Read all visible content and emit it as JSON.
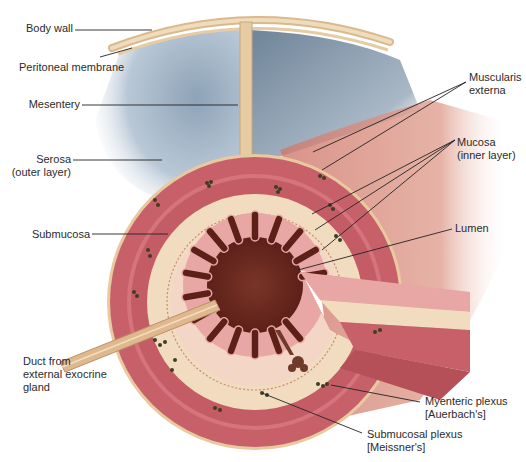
{
  "diagram": {
    "labels": {
      "body_wall": "Body wall",
      "peritoneal_membrane": "Peritoneal membrane",
      "mesentery": "Mesentery",
      "serosa": "Serosa\n(outer layer)",
      "submucosa": "Submucosa",
      "duct": "Duct from\nexternal exocrine\ngland",
      "muscularis_externa": "Muscularis\nexterna",
      "mucosa": "Mucosa\n(inner layer)",
      "lumen": "Lumen",
      "myenteric_plexus": "Myenteric plexus\n[Auerbach's]",
      "submucosal_plexus": "Submucosal plexus\n[Meissner's]"
    },
    "colors": {
      "muscle": "#c8606a",
      "muscle_light": "#e39aa0",
      "submucosa": "#f2dcc0",
      "serosa": "#e8c9a0",
      "mucosa": "#e8a7a4",
      "lumen": "#6e2a22",
      "peritoneal_cavity": "#a8b8c8",
      "body_wall": "#e6cba3",
      "plexus": "#4a4a2a",
      "leader": "#222222"
    }
  }
}
